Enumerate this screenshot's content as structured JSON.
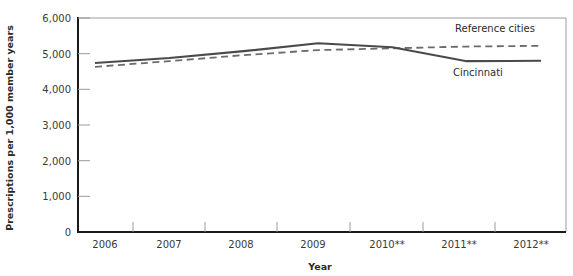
{
  "chart_data": {
    "type": "line",
    "title": "",
    "xlabel": "Year",
    "ylabel": "Prescriptions per 1,000 member years",
    "categories": [
      "2006",
      "2007",
      "2008",
      "2009",
      "2010**",
      "2011**",
      "2012**"
    ],
    "x": [
      2006,
      2007,
      2008,
      2009,
      2010,
      2011,
      2012
    ],
    "ylim": [
      0,
      6000
    ],
    "yticks": [
      0,
      1000,
      2000,
      3000,
      4000,
      5000,
      6000
    ],
    "ytick_labels": [
      "0",
      "1,000",
      "2,000",
      "3,000",
      "4,000",
      "5,000",
      "6,000"
    ],
    "grid": false,
    "legend_position": "inline-annotation",
    "series": [
      {
        "name": "Cincinnati",
        "style": "solid",
        "color": "#4a4a4a",
        "values": [
          4740,
          4880,
          5070,
          5290,
          5180,
          4790,
          4800
        ],
        "label_text": "Cincinnati"
      },
      {
        "name": "Reference cities",
        "style": "dashed",
        "color": "#6b6b6b",
        "values": [
          4630,
          4790,
          4960,
          5100,
          5150,
          5200,
          5220
        ],
        "label_text": "Reference cities"
      }
    ],
    "annotations": [
      {
        "text": "Reference cities",
        "series": "Reference cities"
      },
      {
        "text": "Cincinnati",
        "series": "Cincinnati"
      }
    ]
  },
  "axes": {
    "y_title": "Prescriptions per 1,000 member years",
    "x_title": "Year",
    "y_tick_labels": [
      "6,000",
      "5,000",
      "4,000",
      "3,000",
      "2,000",
      "1,000",
      "0"
    ],
    "x_tick_labels": [
      "2006",
      "2007",
      "2008",
      "2009",
      "2010**",
      "2011**",
      "2012**"
    ]
  },
  "colors": {
    "axis": "#1a1a1a",
    "frame": "#8d8d8d",
    "solid_series": "#4a4a4a",
    "dashed_series": "#6b6b6b",
    "text": "#2b2b2b"
  }
}
